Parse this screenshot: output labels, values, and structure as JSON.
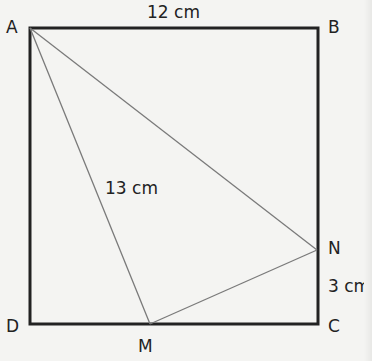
{
  "diagram": {
    "points": {
      "A": {
        "label": "A",
        "x": 30,
        "y": 28
      },
      "B": {
        "label": "B",
        "x": 318,
        "y": 28
      },
      "C": {
        "label": "C",
        "x": 318,
        "y": 324
      },
      "D": {
        "label": "D",
        "x": 30,
        "y": 324
      },
      "M": {
        "label": "M",
        "x": 150,
        "y": 324
      },
      "N": {
        "label": "N",
        "x": 317,
        "y": 250
      }
    },
    "measurements": {
      "AB": "12 cm",
      "AM": "13 cm",
      "NC": "3 cm"
    },
    "colors": {
      "rectangle": "#222222",
      "triangle": "#7a7a7a",
      "background": "#f4f4f2"
    }
  }
}
